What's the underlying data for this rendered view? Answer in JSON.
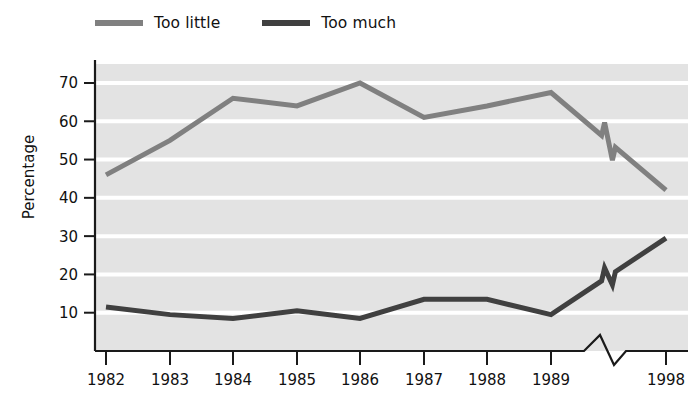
{
  "legend": {
    "items": [
      {
        "label": "Too little",
        "color": "#808080",
        "name": "legend-too-little"
      },
      {
        "label": "Too much",
        "color": "#404040",
        "name": "legend-too-much"
      }
    ]
  },
  "axes": {
    "ylabel": "Percentage",
    "yticks": [
      "10",
      "20",
      "30",
      "40",
      "50",
      "60",
      "70"
    ],
    "xticks": [
      "1982",
      "1983",
      "1984",
      "1985",
      "1986",
      "1987",
      "1988",
      "1989",
      "1998"
    ]
  },
  "chart_data": {
    "type": "line",
    "title": "",
    "xlabel": "",
    "ylabel": "Percentage",
    "x": [
      "1982",
      "1983",
      "1984",
      "1985",
      "1986",
      "1987",
      "1988",
      "1989",
      "1998"
    ],
    "ylim": [
      0,
      76
    ],
    "yticks": [
      10,
      20,
      30,
      40,
      50,
      60,
      70
    ],
    "grid": "horizontal-white-on-gray",
    "axis_break": {
      "present": true,
      "between": [
        "1989",
        "1998"
      ],
      "note": "zigzag break on x-axis and on both data lines"
    },
    "legend_position": "above-plot-left",
    "series": [
      {
        "name": "Too little",
        "color": "#808080",
        "values": [
          46,
          55,
          66,
          64,
          70,
          61,
          64,
          67.5,
          42
        ]
      },
      {
        "name": "Too much",
        "color": "#404040",
        "values": [
          11.5,
          9.5,
          8.5,
          10.5,
          8.5,
          13.5,
          13.5,
          9.5,
          29.5
        ]
      }
    ]
  }
}
